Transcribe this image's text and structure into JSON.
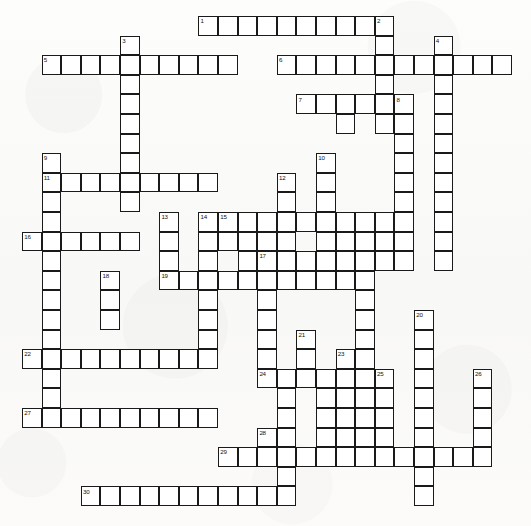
{
  "document": {
    "type": "crossword-puzzle-grid",
    "title": "Crossword Puzzle",
    "description": "Blank crossword grid with numbered entry squares, black outlines on white cells, printed on off-white paper.",
    "background_color": "#fbfbfa",
    "cell_fill_color": "#ffffff",
    "cell_border_color": "#1a1a1a",
    "number_color": "#111111",
    "cell_size_px": 19.6,
    "grid_columns": 26,
    "grid_rows": 26,
    "origin_x_px": 22,
    "origin_y_px": 16,
    "clue_count": 30
  },
  "numbers": [
    {
      "n": "1",
      "col": 9,
      "row": 0
    },
    {
      "n": "2",
      "col": 18,
      "row": 0
    },
    {
      "n": "3",
      "col": 5,
      "row": 1
    },
    {
      "n": "4",
      "col": 21,
      "row": 1
    },
    {
      "n": "5",
      "col": 1,
      "row": 2
    },
    {
      "n": "6",
      "col": 13,
      "row": 2
    },
    {
      "n": "7",
      "col": 14,
      "row": 4
    },
    {
      "n": "8",
      "col": 19,
      "row": 4
    },
    {
      "n": "9",
      "col": 1,
      "row": 7
    },
    {
      "n": "10",
      "col": 15,
      "row": 7
    },
    {
      "n": "11",
      "col": 1,
      "row": 8
    },
    {
      "n": "12",
      "col": 13,
      "row": 8
    },
    {
      "n": "13",
      "col": 7,
      "row": 10
    },
    {
      "n": "14",
      "col": 9,
      "row": 10
    },
    {
      "n": "15",
      "col": 10,
      "row": 10
    },
    {
      "n": "16",
      "col": 0,
      "row": 11
    },
    {
      "n": "17",
      "col": 12,
      "row": 12
    },
    {
      "n": "18",
      "col": 4,
      "row": 13
    },
    {
      "n": "19",
      "col": 7,
      "row": 13
    },
    {
      "n": "20",
      "col": 20,
      "row": 15
    },
    {
      "n": "21",
      "col": 14,
      "row": 16
    },
    {
      "n": "22",
      "col": 0,
      "row": 17
    },
    {
      "n": "23",
      "col": 16,
      "row": 17
    },
    {
      "n": "24",
      "col": 12,
      "row": 18
    },
    {
      "n": "25",
      "col": 18,
      "row": 18
    },
    {
      "n": "26",
      "col": 23,
      "row": 18
    },
    {
      "n": "27",
      "col": 0,
      "row": 20
    },
    {
      "n": "28",
      "col": 12,
      "row": 21
    },
    {
      "n": "29",
      "col": 10,
      "row": 22
    },
    {
      "n": "30",
      "col": 3,
      "row": 24
    }
  ],
  "cells": [
    {
      "col": 9,
      "row": 0
    },
    {
      "col": 10,
      "row": 0
    },
    {
      "col": 11,
      "row": 0
    },
    {
      "col": 12,
      "row": 0
    },
    {
      "col": 13,
      "row": 0
    },
    {
      "col": 14,
      "row": 0
    },
    {
      "col": 15,
      "row": 0
    },
    {
      "col": 16,
      "row": 0
    },
    {
      "col": 17,
      "row": 0
    },
    {
      "col": 18,
      "row": 0
    },
    {
      "col": 5,
      "row": 1
    },
    {
      "col": 18,
      "row": 1
    },
    {
      "col": 21,
      "row": 1
    },
    {
      "col": 1,
      "row": 2
    },
    {
      "col": 2,
      "row": 2
    },
    {
      "col": 3,
      "row": 2
    },
    {
      "col": 4,
      "row": 2
    },
    {
      "col": 5,
      "row": 2
    },
    {
      "col": 6,
      "row": 2
    },
    {
      "col": 7,
      "row": 2
    },
    {
      "col": 8,
      "row": 2
    },
    {
      "col": 9,
      "row": 2
    },
    {
      "col": 10,
      "row": 2
    },
    {
      "col": 13,
      "row": 2
    },
    {
      "col": 14,
      "row": 2
    },
    {
      "col": 15,
      "row": 2
    },
    {
      "col": 16,
      "row": 2
    },
    {
      "col": 17,
      "row": 2
    },
    {
      "col": 18,
      "row": 2
    },
    {
      "col": 19,
      "row": 2
    },
    {
      "col": 20,
      "row": 2
    },
    {
      "col": 21,
      "row": 2
    },
    {
      "col": 22,
      "row": 2
    },
    {
      "col": 23,
      "row": 2
    },
    {
      "col": 24,
      "row": 2
    },
    {
      "col": 5,
      "row": 3
    },
    {
      "col": 18,
      "row": 3
    },
    {
      "col": 21,
      "row": 3
    },
    {
      "col": 5,
      "row": 4
    },
    {
      "col": 14,
      "row": 4
    },
    {
      "col": 15,
      "row": 4
    },
    {
      "col": 16,
      "row": 4
    },
    {
      "col": 17,
      "row": 4
    },
    {
      "col": 18,
      "row": 4
    },
    {
      "col": 19,
      "row": 4
    },
    {
      "col": 21,
      "row": 4
    },
    {
      "col": 5,
      "row": 5
    },
    {
      "col": 16,
      "row": 5
    },
    {
      "col": 18,
      "row": 5
    },
    {
      "col": 19,
      "row": 5
    },
    {
      "col": 21,
      "row": 5
    },
    {
      "col": 5,
      "row": 6
    },
    {
      "col": 19,
      "row": 6
    },
    {
      "col": 21,
      "row": 6
    },
    {
      "col": 1,
      "row": 7
    },
    {
      "col": 5,
      "row": 7
    },
    {
      "col": 15,
      "row": 7
    },
    {
      "col": 19,
      "row": 7
    },
    {
      "col": 21,
      "row": 7
    },
    {
      "col": 1,
      "row": 8
    },
    {
      "col": 2,
      "row": 8
    },
    {
      "col": 3,
      "row": 8
    },
    {
      "col": 4,
      "row": 8
    },
    {
      "col": 5,
      "row": 8
    },
    {
      "col": 6,
      "row": 8
    },
    {
      "col": 7,
      "row": 8
    },
    {
      "col": 8,
      "row": 8
    },
    {
      "col": 9,
      "row": 8
    },
    {
      "col": 13,
      "row": 8
    },
    {
      "col": 15,
      "row": 8
    },
    {
      "col": 19,
      "row": 8
    },
    {
      "col": 21,
      "row": 8
    },
    {
      "col": 1,
      "row": 9
    },
    {
      "col": 5,
      "row": 9
    },
    {
      "col": 13,
      "row": 9
    },
    {
      "col": 15,
      "row": 9
    },
    {
      "col": 19,
      "row": 9
    },
    {
      "col": 21,
      "row": 9
    },
    {
      "col": 1,
      "row": 10
    },
    {
      "col": 7,
      "row": 10
    },
    {
      "col": 9,
      "row": 10
    },
    {
      "col": 10,
      "row": 10
    },
    {
      "col": 11,
      "row": 10
    },
    {
      "col": 12,
      "row": 10
    },
    {
      "col": 13,
      "row": 10
    },
    {
      "col": 14,
      "row": 10
    },
    {
      "col": 15,
      "row": 10
    },
    {
      "col": 16,
      "row": 10
    },
    {
      "col": 17,
      "row": 10
    },
    {
      "col": 18,
      "row": 10
    },
    {
      "col": 19,
      "row": 10
    },
    {
      "col": 21,
      "row": 10
    },
    {
      "col": 0,
      "row": 11
    },
    {
      "col": 1,
      "row": 11
    },
    {
      "col": 2,
      "row": 11
    },
    {
      "col": 3,
      "row": 11
    },
    {
      "col": 4,
      "row": 11
    },
    {
      "col": 5,
      "row": 11
    },
    {
      "col": 7,
      "row": 11
    },
    {
      "col": 9,
      "row": 11
    },
    {
      "col": 10,
      "row": 11
    },
    {
      "col": 11,
      "row": 11
    },
    {
      "col": 12,
      "row": 11
    },
    {
      "col": 13,
      "row": 11
    },
    {
      "col": 15,
      "row": 11
    },
    {
      "col": 16,
      "row": 11
    },
    {
      "col": 17,
      "row": 11
    },
    {
      "col": 18,
      "row": 11
    },
    {
      "col": 19,
      "row": 11
    },
    {
      "col": 21,
      "row": 11
    },
    {
      "col": 1,
      "row": 12
    },
    {
      "col": 7,
      "row": 12
    },
    {
      "col": 9,
      "row": 12
    },
    {
      "col": 11,
      "row": 12
    },
    {
      "col": 12,
      "row": 12
    },
    {
      "col": 13,
      "row": 12
    },
    {
      "col": 14,
      "row": 12
    },
    {
      "col": 15,
      "row": 12
    },
    {
      "col": 16,
      "row": 12
    },
    {
      "col": 17,
      "row": 12
    },
    {
      "col": 18,
      "row": 12
    },
    {
      "col": 19,
      "row": 12
    },
    {
      "col": 21,
      "row": 12
    },
    {
      "col": 1,
      "row": 13
    },
    {
      "col": 4,
      "row": 13
    },
    {
      "col": 7,
      "row": 13
    },
    {
      "col": 8,
      "row": 13
    },
    {
      "col": 9,
      "row": 13
    },
    {
      "col": 10,
      "row": 13
    },
    {
      "col": 11,
      "row": 13
    },
    {
      "col": 12,
      "row": 13
    },
    {
      "col": 13,
      "row": 13
    },
    {
      "col": 14,
      "row": 13
    },
    {
      "col": 15,
      "row": 13
    },
    {
      "col": 16,
      "row": 13
    },
    {
      "col": 17,
      "row": 13
    },
    {
      "col": 1,
      "row": 14
    },
    {
      "col": 4,
      "row": 14
    },
    {
      "col": 9,
      "row": 14
    },
    {
      "col": 12,
      "row": 14
    },
    {
      "col": 17,
      "row": 14
    },
    {
      "col": 1,
      "row": 15
    },
    {
      "col": 4,
      "row": 15
    },
    {
      "col": 9,
      "row": 15
    },
    {
      "col": 12,
      "row": 15
    },
    {
      "col": 17,
      "row": 15
    },
    {
      "col": 20,
      "row": 15
    },
    {
      "col": 1,
      "row": 16
    },
    {
      "col": 9,
      "row": 16
    },
    {
      "col": 12,
      "row": 16
    },
    {
      "col": 14,
      "row": 16
    },
    {
      "col": 17,
      "row": 16
    },
    {
      "col": 20,
      "row": 16
    },
    {
      "col": 0,
      "row": 17
    },
    {
      "col": 1,
      "row": 17
    },
    {
      "col": 2,
      "row": 17
    },
    {
      "col": 3,
      "row": 17
    },
    {
      "col": 4,
      "row": 17
    },
    {
      "col": 5,
      "row": 17
    },
    {
      "col": 6,
      "row": 17
    },
    {
      "col": 7,
      "row": 17
    },
    {
      "col": 8,
      "row": 17
    },
    {
      "col": 9,
      "row": 17
    },
    {
      "col": 12,
      "row": 17
    },
    {
      "col": 14,
      "row": 17
    },
    {
      "col": 16,
      "row": 17
    },
    {
      "col": 17,
      "row": 17
    },
    {
      "col": 20,
      "row": 17
    },
    {
      "col": 1,
      "row": 18
    },
    {
      "col": 12,
      "row": 18
    },
    {
      "col": 13,
      "row": 18
    },
    {
      "col": 14,
      "row": 18
    },
    {
      "col": 15,
      "row": 18
    },
    {
      "col": 16,
      "row": 18
    },
    {
      "col": 17,
      "row": 18
    },
    {
      "col": 18,
      "row": 18
    },
    {
      "col": 20,
      "row": 18
    },
    {
      "col": 23,
      "row": 18
    },
    {
      "col": 1,
      "row": 19
    },
    {
      "col": 13,
      "row": 19
    },
    {
      "col": 15,
      "row": 19
    },
    {
      "col": 16,
      "row": 19
    },
    {
      "col": 17,
      "row": 19
    },
    {
      "col": 18,
      "row": 19
    },
    {
      "col": 20,
      "row": 19
    },
    {
      "col": 23,
      "row": 19
    },
    {
      "col": 0,
      "row": 20
    },
    {
      "col": 1,
      "row": 20
    },
    {
      "col": 2,
      "row": 20
    },
    {
      "col": 3,
      "row": 20
    },
    {
      "col": 4,
      "row": 20
    },
    {
      "col": 5,
      "row": 20
    },
    {
      "col": 6,
      "row": 20
    },
    {
      "col": 7,
      "row": 20
    },
    {
      "col": 8,
      "row": 20
    },
    {
      "col": 9,
      "row": 20
    },
    {
      "col": 13,
      "row": 20
    },
    {
      "col": 15,
      "row": 20
    },
    {
      "col": 16,
      "row": 20
    },
    {
      "col": 17,
      "row": 20
    },
    {
      "col": 18,
      "row": 20
    },
    {
      "col": 20,
      "row": 20
    },
    {
      "col": 23,
      "row": 20
    },
    {
      "col": 12,
      "row": 21
    },
    {
      "col": 13,
      "row": 21
    },
    {
      "col": 15,
      "row": 21
    },
    {
      "col": 16,
      "row": 21
    },
    {
      "col": 17,
      "row": 21
    },
    {
      "col": 18,
      "row": 21
    },
    {
      "col": 20,
      "row": 21
    },
    {
      "col": 23,
      "row": 21
    },
    {
      "col": 10,
      "row": 22
    },
    {
      "col": 11,
      "row": 22
    },
    {
      "col": 12,
      "row": 22
    },
    {
      "col": 13,
      "row": 22
    },
    {
      "col": 14,
      "row": 22
    },
    {
      "col": 15,
      "row": 22
    },
    {
      "col": 16,
      "row": 22
    },
    {
      "col": 17,
      "row": 22
    },
    {
      "col": 18,
      "row": 22
    },
    {
      "col": 19,
      "row": 22
    },
    {
      "col": 20,
      "row": 22
    },
    {
      "col": 21,
      "row": 22
    },
    {
      "col": 22,
      "row": 22
    },
    {
      "col": 23,
      "row": 22
    },
    {
      "col": 13,
      "row": 23
    },
    {
      "col": 20,
      "row": 23
    },
    {
      "col": 3,
      "row": 24
    },
    {
      "col": 4,
      "row": 24
    },
    {
      "col": 5,
      "row": 24
    },
    {
      "col": 6,
      "row": 24
    },
    {
      "col": 7,
      "row": 24
    },
    {
      "col": 8,
      "row": 24
    },
    {
      "col": 9,
      "row": 24
    },
    {
      "col": 10,
      "row": 24
    },
    {
      "col": 11,
      "row": 24
    },
    {
      "col": 12,
      "row": 24
    },
    {
      "col": 13,
      "row": 24
    },
    {
      "col": 20,
      "row": 24
    }
  ]
}
